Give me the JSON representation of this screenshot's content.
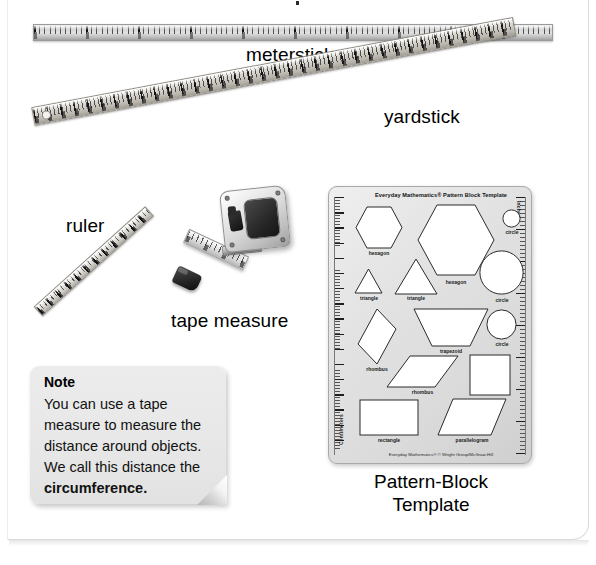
{
  "page": {
    "background_color": "#ffffff",
    "frame_border_color": "#d9d9d9"
  },
  "tools": [
    {
      "id": "meterstick",
      "label": "meterstick",
      "icon": "meterstick-icon"
    },
    {
      "id": "yardstick",
      "label": "yardstick",
      "icon": "yardstick-icon"
    },
    {
      "id": "ruler",
      "label": "ruler",
      "icon": "ruler-icon"
    },
    {
      "id": "tape-measure",
      "label": "tape measure",
      "icon": "tape-measure-icon"
    }
  ],
  "note": {
    "title": "Note",
    "line1": "You can use a tape",
    "line2": "measure to measure the",
    "line3": "distance around objects.",
    "line4": "We call this distance the",
    "bold_term": "circumference."
  },
  "template": {
    "caption_line1": "Pattern-Block",
    "caption_line2": "Template",
    "printed_title": "Everyday Mathematics® Pattern Block Template",
    "printed_footer": "Everyday Mathematics® © Wright Group/McGraw-Hill",
    "left_scale_label": "Centimeters",
    "right_scale_label": "Inches",
    "left_scale_min": "0",
    "left_scale_max": "17",
    "right_scale_min": "0",
    "right_scale_max": "7",
    "body_color": "#e3e3e3",
    "shapes": [
      {
        "name": "hexagon",
        "label": "hexagon"
      },
      {
        "name": "hexagon-large",
        "label": "hexagon"
      },
      {
        "name": "circle-small",
        "label": "circle"
      },
      {
        "name": "triangle-small",
        "label": "triangle"
      },
      {
        "name": "triangle",
        "label": "triangle"
      },
      {
        "name": "circle-large",
        "label": "circle"
      },
      {
        "name": "rhombus-thin",
        "label": "rhombus"
      },
      {
        "name": "trapezoid",
        "label": "trapezoid"
      },
      {
        "name": "circle-medium",
        "label": "circle"
      },
      {
        "name": "rhombus-wide",
        "label": "rhombus"
      },
      {
        "name": "square",
        "label": "square"
      },
      {
        "name": "rectangle",
        "label": "rectangle"
      },
      {
        "name": "parallelogram",
        "label": "parallelogram"
      }
    ]
  }
}
